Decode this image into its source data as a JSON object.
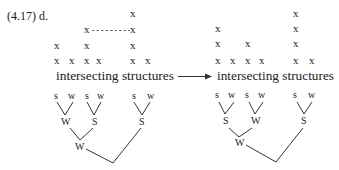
{
  "label": "(4.17) d.",
  "left": {
    "word": "intersecting structures",
    "grid": [
      {
        "x": 133,
        "y": 17
      },
      {
        "x": 87,
        "y": 33
      },
      {
        "x": 133,
        "y": 33
      },
      {
        "x": 57,
        "y": 49
      },
      {
        "x": 87,
        "y": 49
      },
      {
        "x": 133,
        "y": 49
      },
      {
        "x": 57,
        "y": 64
      },
      {
        "x": 72,
        "y": 64
      },
      {
        "x": 87,
        "y": 64
      },
      {
        "x": 99,
        "y": 64
      },
      {
        "x": 133,
        "y": 64
      },
      {
        "x": 148,
        "y": 64
      }
    ],
    "dashed_link": {
      "from": [
        92,
        30
      ],
      "to": [
        130,
        30
      ]
    },
    "grid_mark": "x",
    "tree": {
      "leaves": [
        {
          "label": "s",
          "x": 57,
          "y": 98
        },
        {
          "label": "w",
          "x": 72,
          "y": 98
        },
        {
          "label": "s",
          "x": 88,
          "y": 98
        },
        {
          "label": "w",
          "x": 101,
          "y": 98
        },
        {
          "label": "s",
          "x": 135,
          "y": 98
        },
        {
          "label": "w",
          "x": 151,
          "y": 98
        }
      ],
      "level2": [
        {
          "label": "W",
          "x": 66,
          "y": 124
        },
        {
          "label": "S",
          "x": 95,
          "y": 124
        },
        {
          "label": "S",
          "x": 142,
          "y": 124
        }
      ],
      "level3": [
        {
          "label": "W",
          "x": 80,
          "y": 149
        }
      ]
    }
  },
  "arrow": {
    "label": "→"
  },
  "right": {
    "word": "intersecting structures",
    "grid_mark": "x",
    "tree": {
      "leaves": [
        {
          "label": "s",
          "x": 218,
          "y": 97
        },
        {
          "label": "w",
          "x": 232,
          "y": 97
        },
        {
          "label": "s",
          "x": 248,
          "y": 97
        },
        {
          "label": "w",
          "x": 262,
          "y": 97
        },
        {
          "label": "s",
          "x": 296,
          "y": 97
        },
        {
          "label": "w",
          "x": 312,
          "y": 97
        }
      ],
      "level2": [
        {
          "label": "S",
          "x": 226,
          "y": 124
        },
        {
          "label": "W",
          "x": 256,
          "y": 124
        },
        {
          "label": "S",
          "x": 304,
          "y": 124
        }
      ],
      "level3": [
        {
          "label": "W",
          "x": 240,
          "y": 146
        }
      ]
    }
  }
}
